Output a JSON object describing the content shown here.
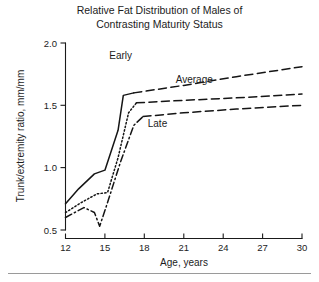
{
  "figure": {
    "title_line1": "Relative Fat Distribution of Males of",
    "title_line2": "Contrasting Maturity Status"
  },
  "chart_data": {
    "type": "line",
    "title": "Relative Fat Distribution of Males of Contrasting Maturity Status",
    "xlabel": "Age, years",
    "ylabel": "Trunk/extremity ratio, mm/mm",
    "xlim": [
      12,
      30
    ],
    "ylim": [
      0.5,
      2.0
    ],
    "xticks": [
      12,
      15,
      18,
      21,
      24,
      27,
      30
    ],
    "xtick_labels": [
      "12",
      "15",
      "18",
      "21",
      "24",
      "27",
      "30"
    ],
    "yticks": [
      0.5,
      1.0,
      1.5,
      2.0
    ],
    "ytick_labels": [
      "0.5",
      "1.0",
      "1.5",
      "2.0"
    ],
    "grid": false,
    "legend_position": "inline-annotations",
    "series": [
      {
        "name": "Early",
        "label": "Early",
        "linestyle": "solid",
        "color": "#151515",
        "x": [
          12.0,
          13.0,
          14.2,
          15.0,
          16.0,
          16.4,
          17.2
        ],
        "y": [
          0.71,
          0.83,
          0.95,
          0.98,
          1.3,
          1.58,
          1.6
        ],
        "extrapolated": {
          "linestyle": "dashed",
          "x": [
            17.2,
            21.0,
            25.0,
            30.0
          ],
          "y": [
            1.6,
            1.66,
            1.73,
            1.81
          ]
        }
      },
      {
        "name": "Average",
        "label": "Average",
        "linestyle": "dotted",
        "color": "#151515",
        "x": [
          12.0,
          13.2,
          14.4,
          15.2,
          16.0,
          16.8,
          17.4
        ],
        "y": [
          0.64,
          0.72,
          0.79,
          0.8,
          1.08,
          1.44,
          1.52
        ],
        "extrapolated": {
          "linestyle": "dashed",
          "x": [
            17.4,
            21.0,
            25.0,
            30.0
          ],
          "y": [
            1.52,
            1.54,
            1.56,
            1.59
          ]
        }
      },
      {
        "name": "Late",
        "label": "Late",
        "linestyle": "dash-dot",
        "color": "#151515",
        "x": [
          12.0,
          13.4,
          14.2,
          14.6,
          15.2,
          16.2,
          17.2,
          17.9
        ],
        "y": [
          0.6,
          0.68,
          0.64,
          0.53,
          0.72,
          1.05,
          1.34,
          1.41
        ],
        "extrapolated": {
          "linestyle": "dashed",
          "x": [
            17.9,
            21.0,
            25.0,
            30.0
          ],
          "y": [
            1.41,
            1.44,
            1.47,
            1.5
          ]
        }
      }
    ],
    "annotations": [
      {
        "text": "Early",
        "x": 16.2,
        "y": 1.87
      },
      {
        "text": "Average",
        "x": 21.8,
        "y": 1.68
      },
      {
        "text": "Late",
        "x": 19.0,
        "y": 1.33
      }
    ]
  }
}
